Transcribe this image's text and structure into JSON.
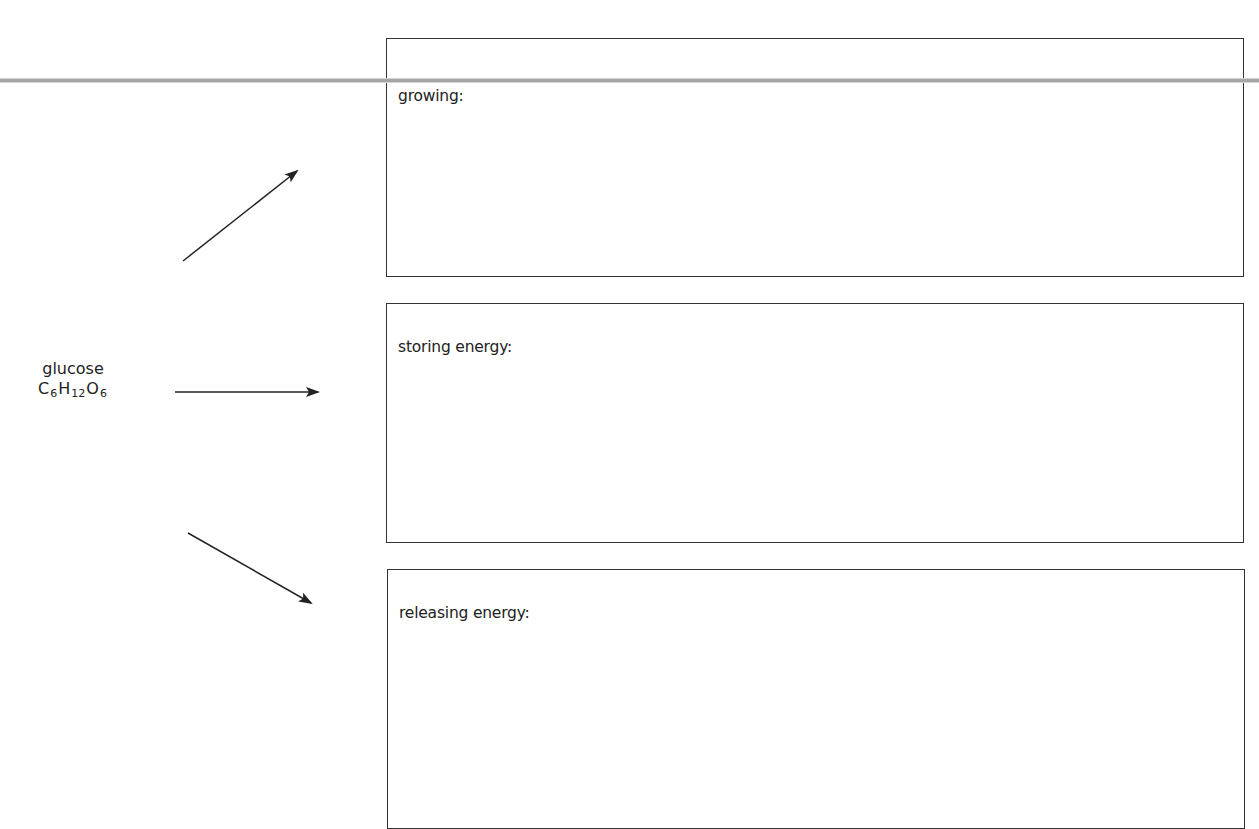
{
  "diagram": {
    "source": {
      "name": "glucose",
      "formula": {
        "parts": [
          {
            "element": "C",
            "count": "6"
          },
          {
            "element": "H",
            "count": "12"
          },
          {
            "element": "O",
            "count": "6"
          }
        ]
      }
    },
    "boxes": [
      {
        "id": "growing",
        "label": "growing:"
      },
      {
        "id": "storing",
        "label": "storing energy:"
      },
      {
        "id": "releasing",
        "label": "releasing energy:"
      }
    ],
    "arrows": [
      {
        "from": "glucose",
        "to": "growing",
        "direction": "up-right"
      },
      {
        "from": "glucose",
        "to": "storing",
        "direction": "right"
      },
      {
        "from": "glucose",
        "to": "releasing",
        "direction": "down-right"
      }
    ]
  },
  "colors": {
    "line": "#222222",
    "box_border": "#333333",
    "rule": "#a6a6a6",
    "background": "#ffffff"
  }
}
